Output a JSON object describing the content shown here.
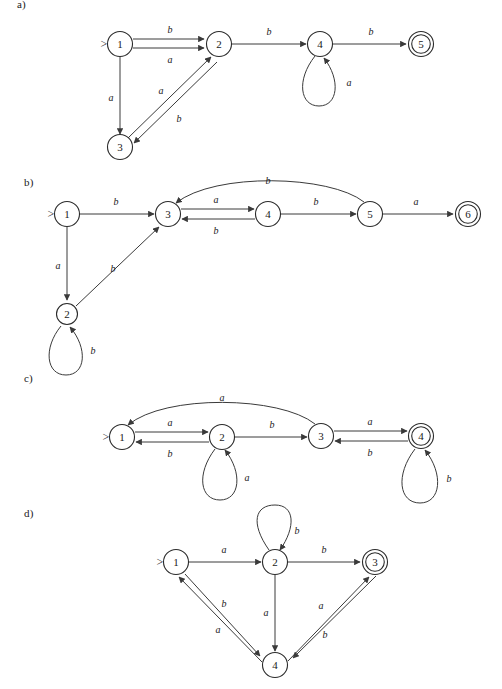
{
  "document": {
    "title": "Finite automata exercise figures",
    "background_color": "#ffffff",
    "ink_color": "#2b2b2b"
  },
  "panels": [
    {
      "id": "a",
      "label": "a)",
      "label_pos": {
        "x": 17,
        "y": 4
      },
      "start_state": "1",
      "accepting_states": [
        "5"
      ],
      "alphabet": [
        "a",
        "b"
      ],
      "states": [
        {
          "name": "1",
          "x": 120,
          "y": 44,
          "accepting": false,
          "start": true
        },
        {
          "name": "2",
          "x": 219,
          "y": 44,
          "accepting": false,
          "start": false
        },
        {
          "name": "3",
          "x": 120,
          "y": 147,
          "accepting": false,
          "start": false
        },
        {
          "name": "4",
          "x": 320,
          "y": 44,
          "accepting": false,
          "start": false
        },
        {
          "name": "5",
          "x": 421,
          "y": 44,
          "accepting": true,
          "start": false
        }
      ],
      "transitions": [
        {
          "from": "1",
          "to": "2",
          "symbol": "b",
          "label_x": 170,
          "label_y": 29
        },
        {
          "from": "1",
          "to": "2",
          "symbol": "a",
          "label_x": 170,
          "label_y": 59
        },
        {
          "from": "1",
          "to": "3",
          "symbol": "a",
          "label_x": 111,
          "label_y": 97
        },
        {
          "from": "3",
          "to": "2",
          "symbol": "a",
          "label_x": 161,
          "label_y": 90
        },
        {
          "from": "2",
          "to": "3",
          "symbol": "b",
          "label_x": 176,
          "label_y": 117
        },
        {
          "from": "2",
          "to": "4",
          "symbol": "b",
          "label_x": 269,
          "label_y": 31
        },
        {
          "from": "4",
          "to": "4",
          "symbol": "a",
          "label_x": 347,
          "label_y": 82
        },
        {
          "from": "4",
          "to": "5",
          "symbol": "b",
          "label_x": 371,
          "label_y": 31
        }
      ]
    },
    {
      "id": "b",
      "label": "b)",
      "label_pos": {
        "x": 24,
        "y": 182
      },
      "start_state": "1",
      "accepting_states": [
        "6"
      ],
      "alphabet": [
        "a",
        "b"
      ],
      "states": [
        {
          "name": "1",
          "x": 67,
          "y": 214,
          "accepting": false,
          "start": true
        },
        {
          "name": "2",
          "x": 67,
          "y": 314,
          "accepting": false,
          "start": false
        },
        {
          "name": "3",
          "x": 168,
          "y": 214,
          "accepting": false,
          "start": false
        },
        {
          "name": "4",
          "x": 268,
          "y": 214,
          "accepting": false,
          "start": false
        },
        {
          "name": "5",
          "x": 370,
          "y": 214,
          "accepting": false,
          "start": false
        },
        {
          "name": "6",
          "x": 468,
          "y": 214,
          "accepting": true,
          "start": false
        }
      ],
      "transitions": [
        {
          "from": "1",
          "to": "3",
          "symbol": "b",
          "label_x": 116,
          "label_y": 201
        },
        {
          "from": "1",
          "to": "2",
          "symbol": "a",
          "label_x": 59,
          "label_y": 265
        },
        {
          "from": "2",
          "to": "3",
          "symbol": "b",
          "label_x": 113,
          "label_y": 268
        },
        {
          "from": "2",
          "to": "2",
          "symbol": "b",
          "label_x": 92,
          "label_y": 349
        },
        {
          "from": "3",
          "to": "4",
          "symbol": "a",
          "label_x": 216,
          "label_y": 202
        },
        {
          "from": "4",
          "to": "3",
          "symbol": "b",
          "label_x": 216,
          "label_y": 228
        },
        {
          "from": "4",
          "to": "5",
          "symbol": "b",
          "label_x": 316,
          "label_y": 201
        },
        {
          "from": "5",
          "to": "3",
          "symbol": "b",
          "label_x": 268,
          "label_y": 180
        },
        {
          "from": "5",
          "to": "6",
          "symbol": "a",
          "label_x": 416,
          "label_y": 201
        }
      ]
    },
    {
      "id": "c",
      "label": "c)",
      "label_pos": {
        "x": 24,
        "y": 378
      },
      "start_state": "1",
      "accepting_states": [
        "4"
      ],
      "alphabet": [
        "a",
        "b"
      ],
      "states": [
        {
          "name": "1",
          "x": 122,
          "y": 437,
          "accepting": false,
          "start": true
        },
        {
          "name": "2",
          "x": 222,
          "y": 437,
          "accepting": false,
          "start": false
        },
        {
          "name": "3",
          "x": 321,
          "y": 436,
          "accepting": false,
          "start": false
        },
        {
          "name": "4",
          "x": 421,
          "y": 436,
          "accepting": true,
          "start": false
        }
      ],
      "transitions": [
        {
          "from": "1",
          "to": "2",
          "symbol": "a",
          "label_x": 170,
          "label_y": 424
        },
        {
          "from": "2",
          "to": "1",
          "symbol": "b",
          "label_x": 170,
          "label_y": 451
        },
        {
          "from": "2",
          "to": "3",
          "symbol": "b",
          "label_x": 272,
          "label_y": 424
        },
        {
          "from": "2",
          "to": "2",
          "symbol": "a",
          "label_x": 246,
          "label_y": 475
        },
        {
          "from": "3",
          "to": "1",
          "symbol": "a",
          "label_x": 222,
          "label_y": 397
        },
        {
          "from": "3",
          "to": "4",
          "symbol": "a",
          "label_x": 370,
          "label_y": 423
        },
        {
          "from": "4",
          "to": "3",
          "symbol": "b",
          "label_x": 370,
          "label_y": 450
        },
        {
          "from": "4",
          "to": "4",
          "symbol": "b",
          "label_x": 447,
          "label_y": 477
        }
      ]
    },
    {
      "id": "d",
      "label": "d)",
      "label_pos": {
        "x": 24,
        "y": 513
      },
      "start_state": "1",
      "accepting_states": [
        "3"
      ],
      "alphabet": [
        "a",
        "b"
      ],
      "states": [
        {
          "name": "1",
          "x": 176,
          "y": 562,
          "accepting": false,
          "start": true
        },
        {
          "name": "2",
          "x": 275,
          "y": 562,
          "accepting": false,
          "start": false
        },
        {
          "name": "3",
          "x": 375,
          "y": 562,
          "accepting": true,
          "start": false
        },
        {
          "name": "4",
          "x": 275,
          "y": 665,
          "accepting": false,
          "start": false
        }
      ],
      "transitions": [
        {
          "from": "1",
          "to": "2",
          "symbol": "a",
          "label_x": 224,
          "label_y": 549
        },
        {
          "from": "2",
          "to": "3",
          "symbol": "b",
          "label_x": 324,
          "label_y": 549
        },
        {
          "from": "2",
          "to": "2",
          "symbol": "b",
          "label_x": 297,
          "label_y": 529
        },
        {
          "from": "2",
          "to": "4",
          "symbol": "a",
          "label_x": 266,
          "label_y": 611
        },
        {
          "from": "1",
          "to": "4",
          "symbol": "b",
          "label_x": 222,
          "label_y": 604
        },
        {
          "from": "4",
          "to": "1",
          "symbol": "a",
          "label_x": 222,
          "label_y": 628
        },
        {
          "from": "4",
          "to": "3",
          "symbol": "a",
          "label_x": 320,
          "label_y": 605
        },
        {
          "from": "3",
          "to": "4",
          "symbol": "b",
          "label_x": 322,
          "label_y": 633
        }
      ]
    }
  ],
  "markers": {
    "start_glyph": ">"
  }
}
